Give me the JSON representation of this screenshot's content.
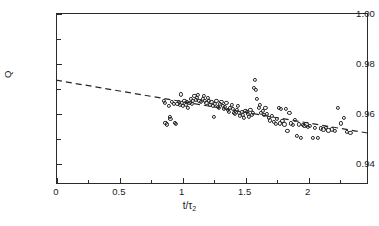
{
  "chart_data": {
    "type": "scatter",
    "title": "",
    "xlabel": "t/τ₂",
    "ylabel": "Q",
    "xlim": [
      0,
      2.48
    ],
    "ylim": [
      0.9318,
      1.0
    ],
    "grid": false,
    "legend": "none",
    "xticks": [
      0,
      0.5,
      1,
      1.5,
      2
    ],
    "xticklabels": [
      "0",
      "0.5",
      "1",
      "1.5",
      "2"
    ],
    "xminorticks": [
      0.25,
      0.75,
      1.25,
      1.75,
      2.25
    ],
    "yticks": [
      0.94,
      0.96,
      0.98,
      1.0
    ],
    "yticklabels": [
      "0.94",
      "0.96",
      "0.98",
      "1.00"
    ],
    "yminorticks": [
      0.95,
      0.97,
      0.99
    ],
    "marker": "open-circle",
    "marker_color": "#262626",
    "fit_line": {
      "style": "dashed",
      "color": "#262626",
      "x": [
        0.0,
        2.48
      ],
      "y": [
        0.9732,
        0.9521
      ],
      "slope": -0.0085,
      "intercept": 0.9732
    },
    "points": [
      [
        0.855,
        0.965
      ],
      [
        0.865,
        0.9641
      ],
      [
        0.87,
        0.9562
      ],
      [
        0.88,
        0.9556
      ],
      [
        0.9,
        0.9631
      ],
      [
        0.905,
        0.9584
      ],
      [
        0.91,
        0.9578
      ],
      [
        0.92,
        0.9644
      ],
      [
        0.935,
        0.9637
      ],
      [
        0.945,
        0.9561
      ],
      [
        0.95,
        0.9557
      ],
      [
        0.965,
        0.9639
      ],
      [
        0.975,
        0.9645
      ],
      [
        0.985,
        0.9633
      ],
      [
        0.995,
        0.9675
      ],
      [
        1.0,
        0.964
      ],
      [
        1.01,
        0.9628
      ],
      [
        1.02,
        0.965
      ],
      [
        1.03,
        0.9634
      ],
      [
        1.04,
        0.9646
      ],
      [
        1.05,
        0.962
      ],
      [
        1.06,
        0.9642
      ],
      [
        1.07,
        0.9659
      ],
      [
        1.08,
        0.9637
      ],
      [
        1.09,
        0.9648
      ],
      [
        1.1,
        0.9668
      ],
      [
        1.11,
        0.9652
      ],
      [
        1.12,
        0.966
      ],
      [
        1.13,
        0.9673
      ],
      [
        1.14,
        0.9651
      ],
      [
        1.15,
        0.9646
      ],
      [
        1.165,
        0.9657
      ],
      [
        1.175,
        0.9669
      ],
      [
        1.185,
        0.9648
      ],
      [
        1.195,
        0.9641
      ],
      [
        1.205,
        0.9662
      ],
      [
        1.215,
        0.965
      ],
      [
        1.225,
        0.9634
      ],
      [
        1.235,
        0.9645
      ],
      [
        1.245,
        0.9629
      ],
      [
        1.255,
        0.9585
      ],
      [
        1.265,
        0.9638
      ],
      [
        1.275,
        0.9651
      ],
      [
        1.285,
        0.9627
      ],
      [
        1.295,
        0.962
      ],
      [
        1.305,
        0.9636
      ],
      [
        1.315,
        0.9644
      ],
      [
        1.325,
        0.963
      ],
      [
        1.335,
        0.9618
      ],
      [
        1.345,
        0.9625
      ],
      [
        1.355,
        0.964
      ],
      [
        1.365,
        0.9613
      ],
      [
        1.375,
        0.9606
      ],
      [
        1.385,
        0.9621
      ],
      [
        1.395,
        0.9634
      ],
      [
        1.405,
        0.9617
      ],
      [
        1.415,
        0.9603
      ],
      [
        1.425,
        0.9596
      ],
      [
        1.435,
        0.9612
      ],
      [
        1.445,
        0.9628
      ],
      [
        1.455,
        0.96
      ],
      [
        1.465,
        0.9589
      ],
      [
        1.475,
        0.9606
      ],
      [
        1.485,
        0.9595
      ],
      [
        1.495,
        0.9583
      ],
      [
        1.505,
        0.9611
      ],
      [
        1.515,
        0.9604
      ],
      [
        1.525,
        0.9598
      ],
      [
        1.535,
        0.9586
      ],
      [
        1.545,
        0.9615
      ],
      [
        1.555,
        0.9592
      ],
      [
        1.565,
        0.9603
      ],
      [
        1.575,
        0.9701
      ],
      [
        1.58,
        0.9733
      ],
      [
        1.59,
        0.9694
      ],
      [
        1.6,
        0.9657
      ],
      [
        1.61,
        0.962
      ],
      [
        1.62,
        0.9634
      ],
      [
        1.63,
        0.9601
      ],
      [
        1.645,
        0.9611
      ],
      [
        1.655,
        0.9592
      ],
      [
        1.665,
        0.962
      ],
      [
        1.675,
        0.9597
      ],
      [
        1.69,
        0.9583
      ],
      [
        1.7,
        0.9572
      ],
      [
        1.715,
        0.9591
      ],
      [
        1.73,
        0.9565
      ],
      [
        1.745,
        0.9557
      ],
      [
        1.755,
        0.9578
      ],
      [
        1.77,
        0.9621
      ],
      [
        1.78,
        0.956
      ],
      [
        1.79,
        0.9619
      ],
      [
        1.8,
        0.957
      ],
      [
        1.815,
        0.9556
      ],
      [
        1.83,
        0.9617
      ],
      [
        1.84,
        0.953
      ],
      [
        1.855,
        0.96
      ],
      [
        1.87,
        0.956
      ],
      [
        1.885,
        0.9553
      ],
      [
        1.9,
        0.9574
      ],
      [
        1.915,
        0.951
      ],
      [
        1.93,
        0.9556
      ],
      [
        1.945,
        0.9502
      ],
      [
        1.96,
        0.9553
      ],
      [
        1.975,
        0.9549
      ],
      [
        1.99,
        0.9556
      ],
      [
        2.005,
        0.9546
      ],
      [
        2.02,
        0.9551
      ],
      [
        2.04,
        0.9501
      ],
      [
        2.06,
        0.9543
      ],
      [
        2.085,
        0.9502
      ],
      [
        2.105,
        0.954
      ],
      [
        2.125,
        0.9536
      ],
      [
        2.145,
        0.9541
      ],
      [
        2.165,
        0.9532
      ],
      [
        2.19,
        0.9536
      ],
      [
        2.215,
        0.9529
      ],
      [
        2.24,
        0.9621
      ],
      [
        2.265,
        0.956
      ],
      [
        2.29,
        0.9583
      ],
      [
        2.315,
        0.9525
      ],
      [
        2.34,
        0.9522
      ]
    ]
  }
}
